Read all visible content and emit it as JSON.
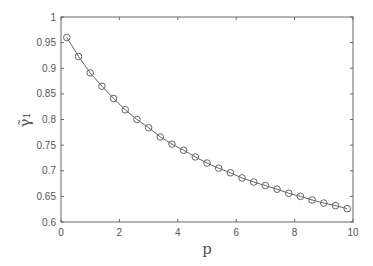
{
  "chart_data": {
    "type": "line",
    "title": "",
    "xlabel": "p",
    "ylabel": "γ̃₁",
    "xlim": [
      0,
      10
    ],
    "ylim": [
      0.6,
      1.0
    ],
    "grid": false,
    "legend": null,
    "xticks": [
      0,
      2,
      4,
      6,
      8,
      10
    ],
    "xtick_labels": [
      "0",
      "2",
      "4",
      "6",
      "8",
      "10"
    ],
    "yticks": [
      0.6,
      0.65,
      0.7,
      0.75,
      0.8,
      0.85,
      0.9,
      0.95,
      1.0
    ],
    "ytick_labels": [
      "0.6",
      "0.65",
      "0.7",
      "0.75",
      "0.8",
      "0.85",
      "0.9",
      "0.95",
      "1"
    ],
    "series": [
      {
        "name": "gamma_tilde_1",
        "marker": "circle",
        "color": "#666666",
        "x": [
          0.2,
          0.6,
          1.0,
          1.4,
          1.8,
          2.2,
          2.6,
          3.0,
          3.4,
          3.8,
          4.2,
          4.6,
          5.0,
          5.4,
          5.8,
          6.2,
          6.6,
          7.0,
          7.4,
          7.8,
          8.2,
          8.6,
          9.0,
          9.4,
          9.8
        ],
        "values": [
          0.96,
          0.923,
          0.891,
          0.865,
          0.841,
          0.819,
          0.8,
          0.784,
          0.766,
          0.752,
          0.74,
          0.727,
          0.715,
          0.705,
          0.696,
          0.686,
          0.678,
          0.671,
          0.664,
          0.656,
          0.65,
          0.643,
          0.637,
          0.632,
          0.626
        ]
      }
    ]
  },
  "plot_area": {
    "left": 61,
    "top": 17,
    "right": 353,
    "bottom": 222
  }
}
